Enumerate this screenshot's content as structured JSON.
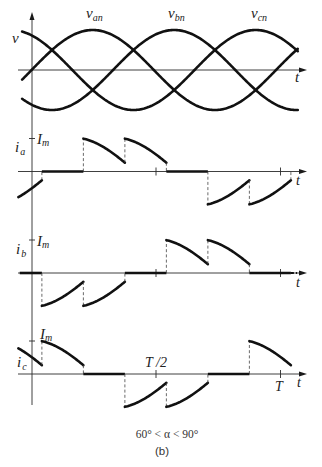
{
  "figure": {
    "caption": "60° < α < 90°",
    "panel_label": "(b)"
  },
  "voltage_panel": {
    "axis_label": "v",
    "time_label": "t",
    "theta_range_deg": [
      -14,
      392
    ],
    "series": [
      {
        "name": "v_an",
        "symbol": "v",
        "subscript": "an",
        "phase_deg": 0
      },
      {
        "name": "v_bn",
        "symbol": "v",
        "subscript": "bn",
        "phase_deg": -120
      },
      {
        "name": "v_cn",
        "symbol": "v",
        "subscript": "cn",
        "phase_deg": 120
      }
    ]
  },
  "current_panels": [
    {
      "name": "i_a",
      "symbol": "i",
      "subscript": "a",
      "peak_symbol": "I",
      "peak_subscript": "m",
      "time_label": "t",
      "segments": [
        {
          "type": "neg",
          "from": -19,
          "to": 15,
          "start": -45
        },
        {
          "type": "zero",
          "from": 15,
          "to": 75
        },
        {
          "type": "pos",
          "from": 75,
          "to": 135
        },
        {
          "type": "pos",
          "from": 135,
          "to": 195
        },
        {
          "type": "zero",
          "from": 195,
          "to": 255
        },
        {
          "type": "neg",
          "from": 255,
          "to": 315
        },
        {
          "type": "neg",
          "from": 315,
          "to": 375,
          "trail_dash": true
        }
      ]
    },
    {
      "name": "i_b",
      "symbol": "i",
      "subscript": "b",
      "peak_symbol": "I",
      "peak_subscript": "m",
      "time_label": "t",
      "segments": [
        {
          "type": "zero",
          "from": -17,
          "to": 15
        },
        {
          "type": "neg",
          "from": 15,
          "to": 75
        },
        {
          "type": "neg",
          "from": 75,
          "to": 135
        },
        {
          "type": "zero",
          "from": 135,
          "to": 195
        },
        {
          "type": "pos",
          "from": 195,
          "to": 255
        },
        {
          "type": "pos",
          "from": 255,
          "to": 315
        },
        {
          "type": "zero",
          "from": 315,
          "to": 375,
          "extend_dash_to": 384
        }
      ]
    },
    {
      "name": "i_c",
      "symbol": "i",
      "subscript": "c",
      "peak_symbol": "I",
      "peak_subscript": "m",
      "time_label": "t",
      "segments": [
        {
          "type": "pos",
          "from": -19,
          "to": 15,
          "start": -45
        },
        {
          "type": "pos",
          "from": 15,
          "to": 75
        },
        {
          "type": "zero",
          "from": 75,
          "to": 135
        },
        {
          "type": "neg",
          "from": 135,
          "to": 195
        },
        {
          "type": "neg",
          "from": 195,
          "to": 255
        },
        {
          "type": "zero",
          "from": 255,
          "to": 315
        },
        {
          "type": "pos",
          "from": 315,
          "to": 375
        }
      ]
    }
  ],
  "time_markers": {
    "half_period_label": "T /2",
    "period_label": "T",
    "ticks_deg": [
      180,
      360
    ]
  }
}
